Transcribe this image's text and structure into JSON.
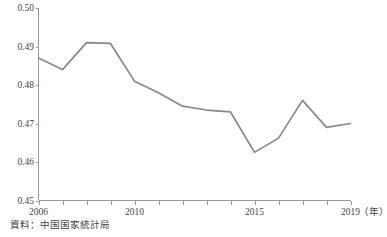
{
  "chart_data": {
    "type": "line",
    "title": "",
    "subtitle": "",
    "xlabel": "年",
    "ylabel": "",
    "x": [
      2006,
      2007,
      2008,
      2009,
      2010,
      2011,
      2012,
      2013,
      2014,
      2015,
      2016,
      2017,
      2018,
      2019
    ],
    "series": [
      {
        "name": "",
        "values": [
          0.487,
          0.484,
          0.491,
          0.4908,
          0.481,
          0.478,
          0.4745,
          0.4735,
          0.473,
          0.4625,
          0.4662,
          0.476,
          0.469,
          0.47
        ]
      }
    ],
    "xlim": [
      2006,
      2019
    ],
    "ylim": [
      0.45,
      0.5
    ],
    "yticks": [
      0.45,
      0.46,
      0.47,
      0.48,
      0.49,
      0.5
    ],
    "ytick_labels": [
      "0.45",
      "0.46",
      "0.47",
      "0.48",
      "0.49",
      "0.50"
    ],
    "xticks": [
      2006,
      2007,
      2008,
      2009,
      2010,
      2011,
      2012,
      2013,
      2014,
      2015,
      2016,
      2017,
      2018,
      2019
    ],
    "xtick_labels_shown": [
      {
        "value": 2006,
        "label": "2006"
      },
      {
        "value": 2010,
        "label": "2010"
      },
      {
        "value": 2015,
        "label": "2015"
      },
      {
        "value": 2019,
        "label": "2019"
      }
    ],
    "x_unit_label": "（年）",
    "grid": false,
    "legend": null,
    "line_color": "#888888",
    "axis_color": "#9a9a9a"
  },
  "footer": {
    "source_note": "資料：中国国家統計局"
  }
}
